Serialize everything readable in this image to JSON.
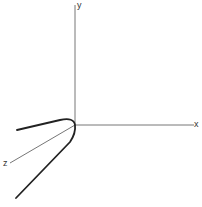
{
  "diagram": {
    "title": "",
    "axes": {
      "x": {
        "label": "x"
      },
      "y": {
        "label": "y"
      },
      "z": {
        "label": "z"
      }
    },
    "colors": {
      "axis": "#555555",
      "curve": "#222222",
      "background": "#ffffff"
    },
    "curve": {
      "description": "Curve with two branches meeting at the origin, one branch toward negative x / upper-left, the other along the z direction toward lower-left"
    }
  }
}
